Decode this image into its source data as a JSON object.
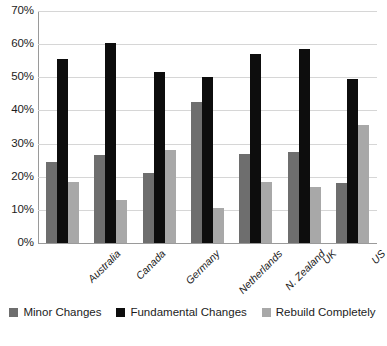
{
  "chart_data": {
    "type": "bar",
    "title": "",
    "xlabel": "",
    "ylabel": "",
    "ylim": [
      0,
      70
    ],
    "ytick_step": 10,
    "ytick_labels": [
      "70%",
      "60%",
      "50%",
      "40%",
      "30%",
      "20%",
      "10%",
      "0%"
    ],
    "ytick_values": [
      70,
      60,
      50,
      40,
      30,
      20,
      10,
      0
    ],
    "grid": true,
    "legend_position": "bottom",
    "value_suffix": "%",
    "categories": [
      "Australia",
      "Canada",
      "Germany",
      "Netherlands",
      "N. Zealand",
      "UK",
      "US"
    ],
    "series": [
      {
        "name": "Minor Changes",
        "color": "#6e6e6e",
        "values": [
          24.5,
          26.5,
          21.0,
          42.5,
          27.0,
          27.5,
          18.0
        ]
      },
      {
        "name": "Fundamental Changes",
        "color": "#0d0d0d",
        "values": [
          55.5,
          60.5,
          51.5,
          50.0,
          57.0,
          58.5,
          49.5
        ]
      },
      {
        "name": "Rebuild Completely",
        "color": "#a8a8a8",
        "values": [
          18.5,
          13.0,
          28.0,
          10.5,
          18.5,
          17.0,
          35.5
        ]
      }
    ]
  },
  "legend": {
    "items": [
      {
        "label": "Minor Changes"
      },
      {
        "label": "Fundamental Changes"
      },
      {
        "label": "Rebuild Completely"
      }
    ]
  },
  "footnote": ""
}
